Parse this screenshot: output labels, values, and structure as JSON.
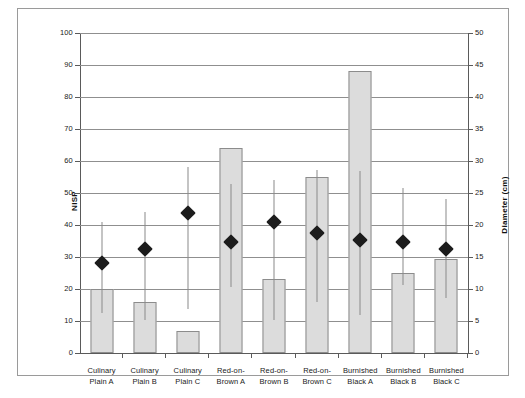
{
  "chart_data": {
    "type": "bar",
    "title": "",
    "categories": [
      "Culinary Plain A",
      "Culinary Plain B",
      "Culinary Plain C",
      "Red-on-Brown A",
      "Red-on-Brown B",
      "Red-on-Brown C",
      "Burnished Black A",
      "Burnished Black B",
      "Burnished Black C"
    ],
    "category_lines": [
      [
        "Culinary",
        "Plain A"
      ],
      [
        "Culinary",
        "Plain B"
      ],
      [
        "Culinary",
        "Plain C"
      ],
      [
        "Red-on-",
        "Brown A"
      ],
      [
        "Red-on-",
        "Brown B"
      ],
      [
        "Red-on-",
        "Brown C"
      ],
      [
        "Burnished",
        "Black A"
      ],
      [
        "Burnished",
        "Black B"
      ],
      [
        "Burnished",
        "Black C"
      ]
    ],
    "series": [
      {
        "name": "NISP",
        "type": "bar",
        "axis": "left",
        "values": [
          20,
          16,
          7,
          64,
          23,
          55,
          88,
          25,
          29.5
        ]
      },
      {
        "name": "Diameter (cm)",
        "type": "scatter-with-range",
        "axis": "right",
        "values": [
          14,
          16.3,
          21.8,
          17.3,
          20.4,
          18.8,
          17.6,
          17.3,
          16.3
        ],
        "range_low": [
          6.2,
          5.2,
          6.8,
          10.3,
          5.2,
          8.0,
          6.0,
          10.6,
          8.6
        ],
        "range_high": [
          20.5,
          22.0,
          29.0,
          26.4,
          27.0,
          28.6,
          28.5,
          25.8,
          24.0
        ]
      }
    ],
    "ylabel": "NISP",
    "ylim": [
      0,
      100
    ],
    "yticks": [
      0,
      10,
      20,
      30,
      40,
      50,
      60,
      70,
      80,
      90,
      100
    ],
    "y2label": "Diameter (cm)",
    "y2lim": [
      0,
      50
    ],
    "y2ticks": [
      0,
      5,
      10,
      15,
      20,
      25,
      30,
      35,
      40,
      45,
      50
    ],
    "xlabel": "",
    "grid": true,
    "legend": "none"
  },
  "colors": {
    "bar_fill": "#dcdcdc",
    "bar_border": "#8c8c8c",
    "marker": "#1c1c1c",
    "whisker": "#8a8a8a",
    "grid": "#8f8f8f",
    "axis": "#5a5a5a",
    "frame": "#9a9a9a",
    "background": "#ffffff"
  }
}
